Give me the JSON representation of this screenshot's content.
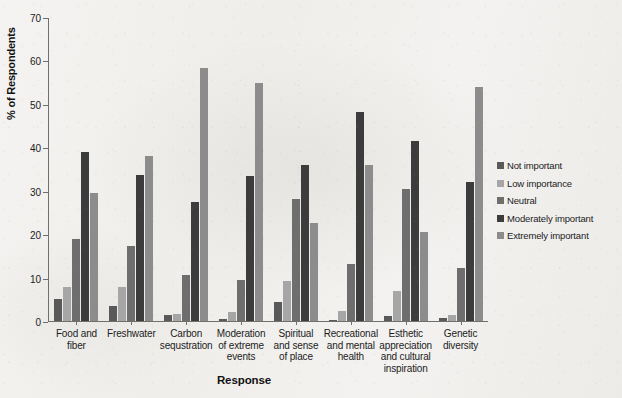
{
  "chart_data": {
    "type": "bar",
    "title": "",
    "xlabel": "Response",
    "ylabel": "% of Respondents",
    "ylim": [
      0,
      70
    ],
    "yticks": [
      0,
      10,
      20,
      30,
      40,
      50,
      60,
      70
    ],
    "grid": false,
    "legend_position": "right",
    "grouping": "grouped",
    "categories": [
      "Food and fiber",
      "Freshwater",
      "Carbon sequstration",
      "Moderation of extreme events",
      "Spiritual and sense of place",
      "Recreational and mental health",
      "Esthetic appreciation and cultural inspiration",
      "Genetic diversity"
    ],
    "category_lines": [
      [
        "Food and",
        "fiber"
      ],
      [
        "Freshwater"
      ],
      [
        "Carbon",
        "sequstration"
      ],
      [
        "Moderation",
        "of extreme",
        "events"
      ],
      [
        "Spiritual",
        "and sense",
        "of place"
      ],
      [
        "Recreational",
        "and mental",
        "health"
      ],
      [
        "Esthetic",
        "appreciation",
        "and cultural",
        "inspiration"
      ],
      [
        "Genetic",
        "diversity"
      ]
    ],
    "series": [
      {
        "name": "Not important",
        "color": "#595959",
        "values": [
          5.0,
          3.4,
          1.4,
          0.4,
          4.4,
          0.2,
          1.2,
          0.6
        ]
      },
      {
        "name": "Low importance",
        "color": "#a6a6a6",
        "values": [
          7.8,
          7.8,
          1.6,
          2.0,
          9.2,
          2.3,
          6.8,
          1.3
        ]
      },
      {
        "name": "Neutral",
        "color": "#6e6e6e",
        "values": [
          19.0,
          17.3,
          10.7,
          9.4,
          28.0,
          13.2,
          30.3,
          12.2
        ]
      },
      {
        "name": "Moderately important",
        "color": "#3c3c3c",
        "values": [
          39.0,
          33.6,
          27.5,
          33.3,
          35.9,
          48.2,
          41.4,
          32.0
        ]
      },
      {
        "name": "Extremely important",
        "color": "#8c8c8c",
        "values": [
          29.5,
          38.1,
          58.2,
          54.9,
          22.6,
          36.0,
          20.5,
          54.0
        ]
      }
    ]
  }
}
